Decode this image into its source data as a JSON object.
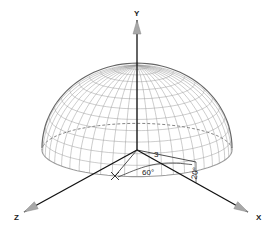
{
  "diagram": {
    "axes": {
      "y": "Y",
      "x": "X",
      "z": "Z"
    },
    "annotations": {
      "radius": "3",
      "azimuth": "60°",
      "elevation": "20°"
    },
    "colors": {
      "wire": "#9a9a9a",
      "axis": "#111111",
      "arrow": "#a8a8a8"
    }
  }
}
